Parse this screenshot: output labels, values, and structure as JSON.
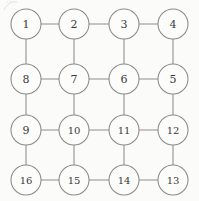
{
  "figure": {
    "kind": "undirected-grid-graph",
    "background_color": "#fbfbf9",
    "stroke_color": "#8d8d8d",
    "label_color": "#3a3a3a",
    "node_fill_color": "#fcfcfa",
    "node_radius": 15,
    "columns_x": [
      26,
      74,
      124,
      173
    ],
    "rows_y": [
      24,
      79,
      130,
      180
    ],
    "artifact_label": "scan-smudge-top-left"
  },
  "nodes": [
    {
      "id": "n1",
      "label": "1",
      "cx": 26,
      "cy": 24,
      "row": 0,
      "col": 0
    },
    {
      "id": "n2",
      "label": "2",
      "cx": 74,
      "cy": 24,
      "row": 0,
      "col": 1
    },
    {
      "id": "n3",
      "label": "3",
      "cx": 124,
      "cy": 24,
      "row": 0,
      "col": 2
    },
    {
      "id": "n4",
      "label": "4",
      "cx": 173,
      "cy": 24,
      "row": 0,
      "col": 3
    },
    {
      "id": "n8",
      "label": "8",
      "cx": 26,
      "cy": 79,
      "row": 1,
      "col": 0
    },
    {
      "id": "n7",
      "label": "7",
      "cx": 74,
      "cy": 79,
      "row": 1,
      "col": 1
    },
    {
      "id": "n6",
      "label": "6",
      "cx": 124,
      "cy": 79,
      "row": 1,
      "col": 2
    },
    {
      "id": "n5",
      "label": "5",
      "cx": 173,
      "cy": 79,
      "row": 1,
      "col": 3
    },
    {
      "id": "n9",
      "label": "9",
      "cx": 26,
      "cy": 130,
      "row": 2,
      "col": 0
    },
    {
      "id": "n10",
      "label": "10",
      "cx": 74,
      "cy": 130,
      "row": 2,
      "col": 1
    },
    {
      "id": "n11",
      "label": "11",
      "cx": 124,
      "cy": 130,
      "row": 2,
      "col": 2
    },
    {
      "id": "n12",
      "label": "12",
      "cx": 173,
      "cy": 130,
      "row": 2,
      "col": 3
    },
    {
      "id": "n16",
      "label": "16",
      "cx": 26,
      "cy": 180,
      "row": 3,
      "col": 0
    },
    {
      "id": "n15",
      "label": "15",
      "cx": 74,
      "cy": 180,
      "row": 3,
      "col": 1
    },
    {
      "id": "n14",
      "label": "14",
      "cx": 124,
      "cy": 180,
      "row": 3,
      "col": 2
    },
    {
      "id": "n13",
      "label": "13",
      "cx": 173,
      "cy": 180,
      "row": 3,
      "col": 3
    }
  ],
  "edges": [
    {
      "from": "n1",
      "to": "n2",
      "orientation": "horizontal"
    },
    {
      "from": "n2",
      "to": "n3",
      "orientation": "horizontal"
    },
    {
      "from": "n3",
      "to": "n4",
      "orientation": "horizontal"
    },
    {
      "from": "n8",
      "to": "n7",
      "orientation": "horizontal"
    },
    {
      "from": "n7",
      "to": "n6",
      "orientation": "horizontal"
    },
    {
      "from": "n6",
      "to": "n5",
      "orientation": "horizontal"
    },
    {
      "from": "n9",
      "to": "n10",
      "orientation": "horizontal"
    },
    {
      "from": "n10",
      "to": "n11",
      "orientation": "horizontal"
    },
    {
      "from": "n11",
      "to": "n12",
      "orientation": "horizontal"
    },
    {
      "from": "n16",
      "to": "n15",
      "orientation": "horizontal"
    },
    {
      "from": "n15",
      "to": "n14",
      "orientation": "horizontal"
    },
    {
      "from": "n14",
      "to": "n13",
      "orientation": "horizontal"
    },
    {
      "from": "n1",
      "to": "n8",
      "orientation": "vertical"
    },
    {
      "from": "n2",
      "to": "n7",
      "orientation": "vertical"
    },
    {
      "from": "n3",
      "to": "n6",
      "orientation": "vertical"
    },
    {
      "from": "n4",
      "to": "n5",
      "orientation": "vertical"
    },
    {
      "from": "n8",
      "to": "n9",
      "orientation": "vertical"
    },
    {
      "from": "n7",
      "to": "n10",
      "orientation": "vertical"
    },
    {
      "from": "n6",
      "to": "n11",
      "orientation": "vertical"
    },
    {
      "from": "n5",
      "to": "n12",
      "orientation": "vertical"
    },
    {
      "from": "n9",
      "to": "n16",
      "orientation": "vertical"
    },
    {
      "from": "n10",
      "to": "n15",
      "orientation": "vertical"
    },
    {
      "from": "n11",
      "to": "n14",
      "orientation": "vertical"
    },
    {
      "from": "n12",
      "to": "n13",
      "orientation": "vertical"
    }
  ]
}
